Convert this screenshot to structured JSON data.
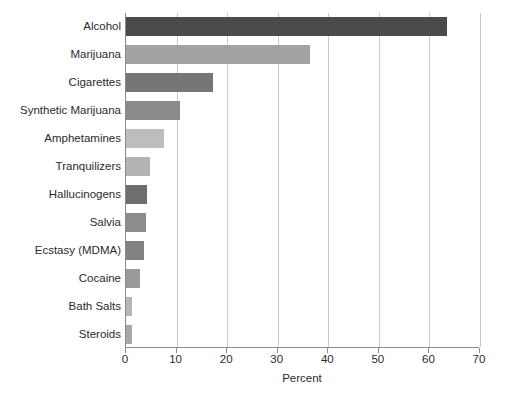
{
  "chart_data": {
    "type": "bar",
    "orientation": "horizontal",
    "title": "",
    "xlabel": "Percent",
    "ylabel": "",
    "xlim": [
      0,
      70
    ],
    "xticks": [
      0,
      10,
      20,
      30,
      40,
      50,
      60,
      70
    ],
    "grid": "vertical",
    "legend": "none",
    "categories": [
      "Alcohol",
      "Marijuana",
      "Cigarettes",
      "Synthetic Marijuana",
      "Amphetamines",
      "Tranquilizers",
      "Hallucinogens",
      "Salvia",
      "Ecstasy (MDMA)",
      "Cocaine",
      "Bath Salts",
      "Steroids"
    ],
    "values": [
      63.5,
      36.4,
      17.2,
      10.6,
      7.5,
      4.7,
      4.2,
      4.0,
      3.6,
      2.7,
      1.1,
      1.2
    ],
    "bar_colors": [
      "#4b4b4b",
      "#a3a3a3",
      "#767676",
      "#8a8a8a",
      "#bdbdbd",
      "#b4b4b4",
      "#6e6e6e",
      "#8c8c8c",
      "#828282",
      "#9a9a9a",
      "#b6b6b6",
      "#a8a8a8"
    ]
  },
  "style": {
    "axis_color": "#8a8a8a",
    "grid_color": "#c9c9c9",
    "text_color": "#2b2b2b",
    "background": "#ffffff"
  }
}
